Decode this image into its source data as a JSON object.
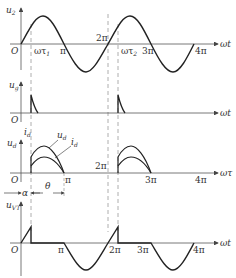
{
  "figure": {
    "colors": {
      "curve": "#222222",
      "axis": "#555555",
      "dashed": "#999999",
      "background": "#ffffff"
    }
  },
  "panels": [
    {
      "id": "u2",
      "ylabel": "u",
      "ylabel_sub": "2",
      "xlabel": "ωt",
      "origin": "O",
      "ticks": [
        {
          "text": "ωτ",
          "sub": "1"
        },
        {
          "text": "π"
        },
        {
          "text": "2π"
        },
        {
          "text": "ωτ",
          "sub": "2"
        },
        {
          "text": "3π"
        },
        {
          "text": "4π"
        }
      ]
    },
    {
      "id": "ug",
      "ylabel": "u",
      "ylabel_sub": "g",
      "xlabel": "ωt",
      "origin": "O"
    },
    {
      "id": "ud_id",
      "ylabel": "u",
      "ylabel_sub": "d",
      "ylabel2": "i",
      "ylabel2_sub": "d",
      "xlabel": "ωτ",
      "origin": "O",
      "curve_labels": [
        {
          "text": "u",
          "sub": "d"
        },
        {
          "text": "i",
          "sub": "d"
        }
      ],
      "ticks": [
        {
          "text": "π"
        },
        {
          "text": "2π"
        },
        {
          "text": "3π"
        },
        {
          "text": "4π"
        }
      ],
      "annotations": [
        {
          "text": "α"
        },
        {
          "text": "θ"
        }
      ]
    },
    {
      "id": "uVT",
      "ylabel": "u",
      "ylabel_sub": "VT",
      "xlabel": "ωt",
      "origin": "O",
      "ticks": [
        {
          "text": "π"
        },
        {
          "text": "2π"
        },
        {
          "text": "3π"
        },
        {
          "text": "4π"
        }
      ]
    }
  ]
}
